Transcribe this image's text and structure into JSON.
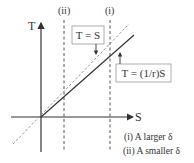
{
  "axes": {
    "y_label": "T",
    "x_label": "S"
  },
  "vertical_markers": [
    {
      "label": "(ii)",
      "meaning": "A smaller δ"
    },
    {
      "label": "(i)",
      "meaning": "A larger δ"
    }
  ],
  "lines": [
    {
      "name": "T = S",
      "style": "dashed",
      "label": "T = S"
    },
    {
      "name": "T = (1/r)S",
      "style": "solid",
      "label": "T = (1/r)S"
    }
  ],
  "legend": {
    "item_i": "(i) A larger δ",
    "item_ii": "(ii) A smaller δ"
  },
  "colors": {
    "ink": "#333333",
    "dashed_line": "#888888",
    "box_border": "#999999"
  }
}
